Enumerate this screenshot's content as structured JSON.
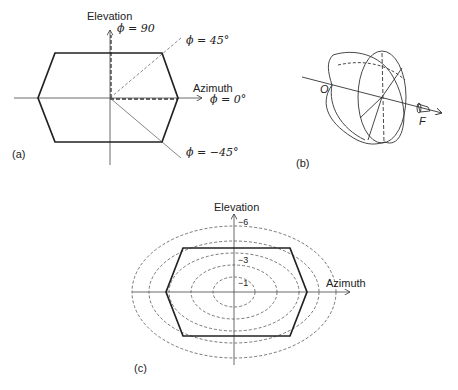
{
  "panels": {
    "a": {
      "tag": "(a)",
      "y_axis_label": "Elevation",
      "x_axis_label": "Azimuth",
      "angle_labels": {
        "phi90": "ϕ = 90",
        "phi45": "ϕ = 45°",
        "phi0": "ϕ = 0°",
        "phim45": "ϕ = −45°"
      }
    },
    "b": {
      "tag": "(b)",
      "point_o": "O",
      "point_f": "F"
    },
    "c": {
      "tag": "(c)",
      "y_axis_label": "Elevation",
      "x_axis_label": "Azimuth",
      "contour_labels": [
        "−6",
        "−3",
        "−1"
      ]
    }
  }
}
